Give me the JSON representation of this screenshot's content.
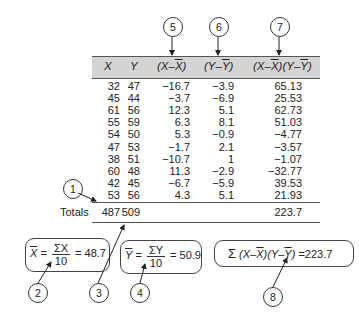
{
  "table": {
    "headers": [
      "X",
      "Y",
      "(X−X̄)",
      "(Y−Ȳ)",
      "(X−X̄)(Y−Ȳ)"
    ],
    "header_parts": {
      "x": "X",
      "y": "Y",
      "xdev_a": "(X–",
      "xdev_b": "X",
      "xdev_c": ")",
      "ydev_a": "(Y–",
      "ydev_b": "Y",
      "ydev_c": ")",
      "prod_a": "(X–",
      "prod_b": "X",
      "prod_c": ")(Y–",
      "prod_d": "Y",
      "prod_e": ")"
    },
    "rows": [
      {
        "x": "32",
        "y": "47",
        "xdev": "−16.7",
        "ydev": "−3.9",
        "prod": "65.13"
      },
      {
        "x": "45",
        "y": "44",
        "xdev": "−3.7",
        "ydev": "−6.9",
        "prod": "25.53"
      },
      {
        "x": "61",
        "y": "56",
        "xdev": "12.3",
        "ydev": "5.1",
        "prod": "62.73"
      },
      {
        "x": "55",
        "y": "59",
        "xdev": "6.3",
        "ydev": "8.1",
        "prod": "51.03"
      },
      {
        "x": "54",
        "y": "50",
        "xdev": "5.3",
        "ydev": "−0.9",
        "prod": "−4.77"
      },
      {
        "x": "47",
        "y": "53",
        "xdev": "−1.7",
        "ydev": "2.1",
        "prod": "−3.57"
      },
      {
        "x": "38",
        "y": "51",
        "xdev": "−10.7",
        "ydev": "1",
        "prod": "−1.07"
      },
      {
        "x": "60",
        "y": "48",
        "xdev": "11.3",
        "ydev": "−2.9",
        "prod": "−32.77"
      },
      {
        "x": "42",
        "y": "45",
        "xdev": "−6.7",
        "ydev": "−5.9",
        "prod": "39.53"
      },
      {
        "x": "53",
        "y": "56",
        "xdev": "4.3",
        "ydev": "5.1",
        "prod": "21.93"
      }
    ],
    "totals": {
      "label": "Totals",
      "x": "487",
      "y": "509",
      "prod": "223.7"
    }
  },
  "callouts": [
    "1",
    "2",
    "3",
    "4",
    "5",
    "6",
    "7",
    "8"
  ],
  "formulas": {
    "xbar": {
      "lhs": "X",
      "num": "ΣX",
      "den": "10",
      "result": "= 48.7"
    },
    "ybar": {
      "lhs": "Y",
      "num": "ΣY",
      "den": "10",
      "result": "= 50.9"
    },
    "sum": {
      "sigma": "Σ",
      "a": "(X–",
      "b": "X",
      "c": ")(Y–",
      "d": "Y",
      "e": ")",
      "result": "=223.7"
    }
  },
  "colors": {
    "header_band": "#d4d4d4",
    "lines": "#555555"
  }
}
